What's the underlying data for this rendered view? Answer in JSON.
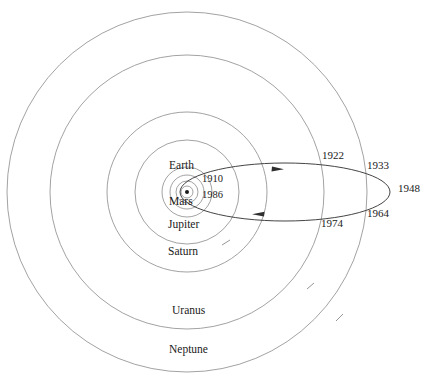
{
  "figure": {
    "kind": "orbit-diagram",
    "background_color": "#ffffff",
    "line_color": "#6e6e6e",
    "comet_line_color": "#3a3a3a",
    "text_color": "#1a1a1a"
  },
  "sun": {
    "label": "",
    "cx": 187,
    "cy": 192,
    "dot_radius": 2.0
  },
  "planet_orbits": [
    {
      "name": "Mercury",
      "label": "",
      "radius": 6,
      "label_x": 0,
      "label_y": 0
    },
    {
      "name": "Venus",
      "label": "",
      "radius": 11,
      "label_x": 0,
      "label_y": 0
    },
    {
      "name": "Earth",
      "label": "Earth",
      "radius": 17,
      "label_x": 169,
      "label_y": 165
    },
    {
      "name": "Mars",
      "label": "Mars",
      "radius": 25,
      "label_x": 169,
      "label_y": 200
    },
    {
      "name": "Jupiter",
      "label": "Jupiter",
      "radius": 52,
      "label_x": 168,
      "label_y": 223
    },
    {
      "name": "Saturn",
      "label": "Saturn",
      "radius": 80,
      "label_x": 168,
      "label_y": 250
    },
    {
      "name": "Uranus",
      "label": "Uranus",
      "radius": 137,
      "label_x": 172,
      "label_y": 309
    },
    {
      "name": "Neptune",
      "label": "Neptune",
      "radius": 180,
      "label_x": 169,
      "label_y": 348
    }
  ],
  "comet_orbit": {
    "name": "comet-orbit",
    "perihelion_x": 180,
    "aphelion_x": 390,
    "center_y": 192,
    "semi_minor": 29,
    "direction_arrow_upper": "right",
    "direction_arrow_lower": "left"
  },
  "year_markers": [
    {
      "label": "1910",
      "x": 202,
      "y": 178,
      "size": "inner"
    },
    {
      "label": "1986",
      "x": 202,
      "y": 194,
      "size": "inner"
    },
    {
      "label": "1922",
      "x": 322,
      "y": 150,
      "size": "outer"
    },
    {
      "label": "1933",
      "x": 367,
      "y": 160,
      "size": "outer"
    },
    {
      "label": "1948",
      "x": 398,
      "y": 187,
      "size": "outer"
    },
    {
      "label": "1964",
      "x": 367,
      "y": 212,
      "size": "outer"
    },
    {
      "label": "1974",
      "x": 321,
      "y": 222,
      "size": "outer"
    }
  ],
  "orbit_direction_ticks": [
    {
      "name": "uranus-direction-tick",
      "orbit": "Uranus",
      "angle_deg": 55
    },
    {
      "name": "saturn-direction-tick",
      "orbit": "Saturn",
      "angle_deg": 62
    },
    {
      "name": "neptune-direction-tick",
      "orbit": "Neptune",
      "angle_deg": 48
    }
  ]
}
